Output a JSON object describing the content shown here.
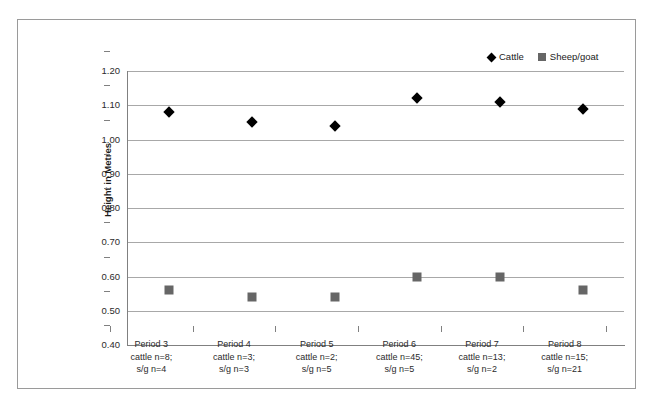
{
  "chart_data": {
    "type": "scatter",
    "title": "",
    "xlabel": "",
    "ylabel": "Height in Metres",
    "ylim": [
      0.4,
      1.2
    ],
    "ytick_labels": [
      "1.20",
      "1.10",
      "1.00",
      "0.90",
      "0.80",
      "0.70",
      "0.60",
      "0.50",
      "0.40"
    ],
    "ytick_values": [
      1.2,
      1.1,
      1.0,
      0.9,
      0.8,
      0.7,
      0.6,
      0.5,
      0.4
    ],
    "grid": true,
    "legend_position": "top-right",
    "categories": [
      "Period 3\ncattle n=8;\ns/g n=4",
      "Period 4\ncattle n=3;\ns/g n=3",
      "Period 5\ncattle n=2;\ns/g n=5",
      "Period 6\ncattle n=45;\ns/g n=5",
      "Period 7\ncattle n=13;\ns/g n=2",
      "Period 8\ncattle n=15;\ns/g n=21"
    ],
    "category_lines": [
      [
        "Period 3",
        "cattle n=8;",
        "s/g n=4"
      ],
      [
        "Period 4",
        "cattle n=3;",
        "s/g n=3"
      ],
      [
        "Period 5",
        "cattle n=2;",
        "s/g n=5"
      ],
      [
        "Period 6",
        "cattle n=45;",
        "s/g n=5"
      ],
      [
        "Period 7",
        "cattle n=13;",
        "s/g n=2"
      ],
      [
        "Period 8",
        "cattle n=15;",
        "s/g n=21"
      ]
    ],
    "series": [
      {
        "name": "Cattle",
        "marker": "diamond",
        "color": "#000000",
        "values": [
          1.08,
          1.05,
          1.04,
          1.12,
          1.11,
          1.09
        ]
      },
      {
        "name": "Sheep/goat",
        "marker": "square",
        "color": "#666666",
        "values": [
          0.56,
          0.54,
          0.54,
          0.6,
          0.6,
          0.56
        ]
      }
    ]
  },
  "legend": {
    "entries": [
      {
        "label": "Cattle",
        "marker": "diamond",
        "color": "#000000"
      },
      {
        "label": "Sheep/goat",
        "marker": "square",
        "color": "#666666"
      }
    ]
  },
  "axis": {
    "y_title": "Height in Metres"
  },
  "colors": {
    "cattle": "#000000",
    "sheep_goat": "#666666",
    "gridline": "#a8a8a8",
    "axis": "#808080",
    "frame_border": "#9a9a9a",
    "background": "#ffffff"
  }
}
